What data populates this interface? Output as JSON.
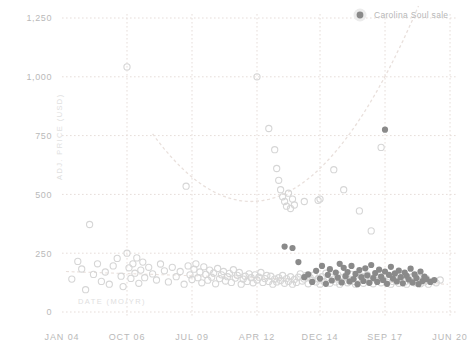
{
  "legend": {
    "position": "top-right",
    "marker_name": "legend-marker-icon",
    "entries": [
      {
        "label": "Carolina Soul sale",
        "color": "#8a8a8a"
      }
    ]
  },
  "colors": {
    "carolina_soul_marker": "#8a8a8a",
    "other_sale_marker": "#d6d6d6",
    "gridline": "#e6ddd9",
    "trendline": "#e9e0dc",
    "tick_label": "#b9b9b9",
    "axis_title": "#e0e0e0",
    "background": "#ffffff"
  },
  "chart_data": {
    "type": "scatter",
    "title": "",
    "subtitle": "",
    "xlabel": "DATE (MO/YR)",
    "ylabel": "ADJ. PRICE (USD)",
    "grid": true,
    "xlim": [
      0,
      198
    ],
    "ylim": [
      0,
      1250
    ],
    "x_tick_values": [
      0,
      33,
      66,
      99,
      131,
      164,
      197
    ],
    "x_tick_labels": [
      "JAN 04",
      "OCT 06",
      "JUL 09",
      "APR 12",
      "DEC 14",
      "SEP 17",
      "JUN 20"
    ],
    "y_tick_values": [
      0,
      250,
      500,
      750,
      1000,
      1250
    ],
    "y_tick_labels": [
      "0",
      "250",
      "500",
      "750",
      "1,000",
      "1,250"
    ],
    "annotations": [],
    "trendline": {
      "name": "quadratic-fit",
      "style": "dashed",
      "type": "parabola",
      "vertex_x": 96,
      "vertex_y": 470,
      "curvature": 0.115,
      "x_start": 46,
      "x_end": 196
    },
    "series": [
      {
        "name": "Other sale",
        "marker": "open-circle",
        "color": "#d6d6d6",
        "points": [
          [
            5,
            140
          ],
          [
            8,
            215
          ],
          [
            10,
            183
          ],
          [
            12,
            95
          ],
          [
            14,
            372
          ],
          [
            16,
            160
          ],
          [
            18,
            205
          ],
          [
            20,
            130
          ],
          [
            22,
            170
          ],
          [
            24,
            118
          ],
          [
            26,
            196
          ],
          [
            28,
            228
          ],
          [
            30,
            152
          ],
          [
            31,
            108
          ],
          [
            33,
            1042
          ],
          [
            33,
            250
          ],
          [
            34,
            188
          ],
          [
            35,
            143
          ],
          [
            36,
            205
          ],
          [
            37,
            165
          ],
          [
            38,
            230
          ],
          [
            39,
            122
          ],
          [
            40,
            178
          ],
          [
            41,
            212
          ],
          [
            42,
            146
          ],
          [
            44,
            190
          ],
          [
            46,
            162
          ],
          [
            48,
            136
          ],
          [
            50,
            204
          ],
          [
            52,
            175
          ],
          [
            54,
            128
          ],
          [
            56,
            190
          ],
          [
            58,
            150
          ],
          [
            60,
            172
          ],
          [
            62,
            118
          ],
          [
            63,
            535
          ],
          [
            64,
            196
          ],
          [
            65,
            158
          ],
          [
            66,
            138
          ],
          [
            67,
            182
          ],
          [
            68,
            205
          ],
          [
            69,
            146
          ],
          [
            70,
            170
          ],
          [
            71,
            124
          ],
          [
            72,
            192
          ],
          [
            73,
            160
          ],
          [
            74,
            135
          ],
          [
            75,
            178
          ],
          [
            76,
            148
          ],
          [
            77,
            166
          ],
          [
            78,
            120
          ],
          [
            79,
            185
          ],
          [
            80,
            142
          ],
          [
            81,
            158
          ],
          [
            82,
            172
          ],
          [
            83,
            132
          ],
          [
            84,
            150
          ],
          [
            85,
            164
          ],
          [
            86,
            126
          ],
          [
            87,
            180
          ],
          [
            88,
            144
          ],
          [
            89,
            156
          ],
          [
            90,
            168
          ],
          [
            91,
            118
          ],
          [
            92,
            140
          ],
          [
            93,
            152
          ],
          [
            94,
            130
          ],
          [
            95,
            162
          ],
          [
            96,
            146
          ],
          [
            97,
            124
          ],
          [
            98,
            158
          ],
          [
            99,
            1000
          ],
          [
            99,
            136
          ],
          [
            100,
            148
          ],
          [
            101,
            168
          ],
          [
            102,
            126
          ],
          [
            103,
            142
          ],
          [
            104,
            155
          ],
          [
            105,
            780
          ],
          [
            105,
            130
          ],
          [
            106,
            152
          ],
          [
            107,
            118
          ],
          [
            108,
            690
          ],
          [
            108,
            140
          ],
          [
            109,
            610
          ],
          [
            109,
            128
          ],
          [
            110,
            560
          ],
          [
            110,
            146
          ],
          [
            111,
            520
          ],
          [
            111,
            134
          ],
          [
            112,
            490
          ],
          [
            112,
            155
          ],
          [
            113,
            470
          ],
          [
            113,
            122
          ],
          [
            114,
            450
          ],
          [
            114,
            142
          ],
          [
            115,
            505
          ],
          [
            115,
            130
          ],
          [
            116,
            440
          ],
          [
            116,
            150
          ],
          [
            117,
            480
          ],
          [
            117,
            118
          ],
          [
            118,
            455
          ],
          [
            118,
            138
          ],
          [
            119,
            126
          ],
          [
            120,
            148
          ],
          [
            121,
            162
          ],
          [
            122,
            132
          ],
          [
            123,
            470
          ],
          [
            123,
            140
          ],
          [
            124,
            155
          ],
          [
            125,
            120
          ],
          [
            126,
            146
          ],
          [
            127,
            134
          ],
          [
            128,
            158
          ],
          [
            129,
            128
          ],
          [
            130,
            475
          ],
          [
            130,
            142
          ],
          [
            131,
            480
          ],
          [
            131,
            118
          ],
          [
            132,
            150
          ],
          [
            133,
            130
          ],
          [
            134,
            165
          ],
          [
            135,
            136
          ],
          [
            136,
            122
          ],
          [
            137,
            148
          ],
          [
            138,
            605
          ],
          [
            138,
            140
          ],
          [
            139,
            128
          ],
          [
            140,
            158
          ],
          [
            141,
            118
          ],
          [
            142,
            146
          ],
          [
            143,
            520
          ],
          [
            143,
            132
          ],
          [
            144,
            152
          ],
          [
            145,
            124
          ],
          [
            146,
            140
          ],
          [
            147,
            160
          ],
          [
            148,
            130
          ],
          [
            149,
            118
          ],
          [
            150,
            146
          ],
          [
            151,
            430
          ],
          [
            151,
            136
          ],
          [
            152,
            152
          ],
          [
            153,
            122
          ],
          [
            154,
            142
          ],
          [
            155,
            158
          ],
          [
            156,
            128
          ],
          [
            157,
            345
          ],
          [
            157,
            140
          ],
          [
            158,
            120
          ],
          [
            159,
            150
          ],
          [
            160,
            134
          ],
          [
            161,
            146
          ],
          [
            162,
            700
          ],
          [
            162,
            124
          ],
          [
            163,
            138
          ],
          [
            164,
            155
          ],
          [
            165,
            126
          ],
          [
            166,
            142
          ],
          [
            167,
            118
          ],
          [
            168,
            130
          ],
          [
            169,
            148
          ],
          [
            170,
            136
          ],
          [
            171,
            122
          ],
          [
            172,
            144
          ],
          [
            173,
            156
          ],
          [
            174,
            128
          ],
          [
            175,
            118
          ],
          [
            176,
            140
          ],
          [
            177,
            132
          ],
          [
            178,
            150
          ],
          [
            179,
            124
          ],
          [
            180,
            138
          ],
          [
            181,
            146
          ],
          [
            182,
            120
          ],
          [
            183,
            134
          ],
          [
            184,
            128
          ],
          [
            185,
            142
          ],
          [
            186,
            118
          ],
          [
            188,
            130
          ],
          [
            190,
            124
          ],
          [
            192,
            136
          ]
        ]
      },
      {
        "name": "Carolina Soul sale",
        "marker": "filled-circle",
        "color": "#8a8a8a",
        "points": [
          [
            113,
            278
          ],
          [
            117,
            272
          ],
          [
            120,
            212
          ],
          [
            123,
            148
          ],
          [
            125,
            160
          ],
          [
            127,
            128
          ],
          [
            129,
            175
          ],
          [
            131,
            142
          ],
          [
            132,
            196
          ],
          [
            134,
            120
          ],
          [
            135,
            158
          ],
          [
            136,
            182
          ],
          [
            137,
            134
          ],
          [
            139,
            168
          ],
          [
            140,
            146
          ],
          [
            141,
            205
          ],
          [
            142,
            126
          ],
          [
            143,
            188
          ],
          [
            144,
            152
          ],
          [
            145,
            170
          ],
          [
            146,
            130
          ],
          [
            147,
            196
          ],
          [
            148,
            140
          ],
          [
            149,
            162
          ],
          [
            150,
            118
          ],
          [
            151,
            178
          ],
          [
            152,
            148
          ],
          [
            153,
            132
          ],
          [
            154,
            186
          ],
          [
            155,
            156
          ],
          [
            156,
            124
          ],
          [
            157,
            200
          ],
          [
            158,
            144
          ],
          [
            159,
            166
          ],
          [
            160,
            128
          ],
          [
            161,
            180
          ],
          [
            162,
            150
          ],
          [
            163,
            136
          ],
          [
            164,
            775
          ],
          [
            164,
            172
          ],
          [
            165,
            120
          ],
          [
            166,
            158
          ],
          [
            167,
            192
          ],
          [
            168,
            142
          ],
          [
            169,
            164
          ],
          [
            170,
            130
          ],
          [
            171,
            176
          ],
          [
            172,
            148
          ],
          [
            173,
            122
          ],
          [
            174,
            168
          ],
          [
            175,
            154
          ],
          [
            176,
            138
          ],
          [
            177,
            184
          ],
          [
            178,
            126
          ],
          [
            179,
            160
          ],
          [
            180,
            144
          ],
          [
            181,
            118
          ],
          [
            182,
            172
          ],
          [
            183,
            132
          ],
          [
            184,
            150
          ],
          [
            185,
            140
          ],
          [
            187,
            128
          ],
          [
            189,
            136
          ]
        ]
      }
    ]
  }
}
